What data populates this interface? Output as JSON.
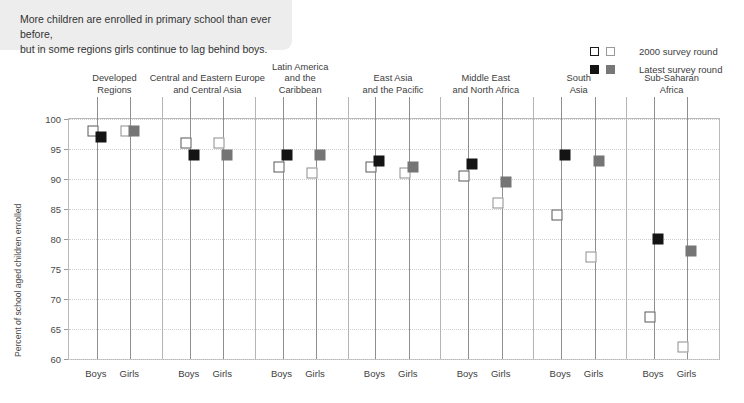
{
  "banner": {
    "text": "More children are enrolled in primary school than ever before,\nbut in some regions girls continue to lag behind boys."
  },
  "legend": {
    "items": [
      {
        "label": "2000 survey round",
        "swatch_dark": "open-dark",
        "swatch_gray": "open-gray"
      },
      {
        "label": "Latest survey round",
        "swatch_dark": "fill-dark",
        "swatch_gray": "fill-gray"
      }
    ]
  },
  "colors": {
    "boys_2000": "#ffffff",
    "boys_2000_edge": "#595959",
    "boys_latest": "#141414",
    "girls_2000": "#ffffff",
    "girls_2000_edge": "#8d8d8d",
    "girls_latest": "#757575",
    "banner_bg": "#ededed",
    "gridline": "#cfcfcf",
    "axis": "#b9b9b9"
  },
  "chart_data": {
    "type": "scatter",
    "title": "More children are enrolled in primary school than ever before, but in some regions girls continue to lag behind boys.",
    "xlabel": "",
    "ylabel": "Percent of school aged children enrolled",
    "ylim": [
      60,
      100
    ],
    "yticks": [
      60,
      65,
      70,
      75,
      80,
      85,
      90,
      95,
      100
    ],
    "grid": true,
    "legend_position": "top-right",
    "group_labels": [
      "Boys",
      "Girls"
    ],
    "categories": [
      "Developed\nRegions",
      "Central and Eastern Europe\nand Central Asia",
      "Latin America\nand the\nCaribbean",
      "East Asia\nand the Pacific",
      "Middle East\nand North Africa",
      "South\nAsia",
      "Sub-Saharan\nAfrica"
    ],
    "series": [
      {
        "name": "2000 survey round",
        "group": "Boys",
        "values": [
          98.0,
          96.0,
          92.0,
          92.0,
          90.5,
          84.0,
          67.0
        ]
      },
      {
        "name": "Latest survey round",
        "group": "Boys",
        "values": [
          97.0,
          94.0,
          94.0,
          93.0,
          92.5,
          94.0,
          80.0
        ]
      },
      {
        "name": "2000 survey round",
        "group": "Girls",
        "values": [
          98.0,
          96.0,
          91.0,
          91.0,
          86.0,
          77.0,
          62.0
        ]
      },
      {
        "name": "Latest survey round",
        "group": "Girls",
        "values": [
          98.0,
          94.0,
          94.0,
          92.0,
          89.5,
          93.0,
          78.0
        ]
      }
    ]
  }
}
